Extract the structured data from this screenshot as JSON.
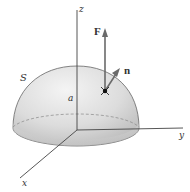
{
  "diagram": {
    "type": "hemisphere-surface-flux",
    "labels": {
      "z_axis": "z",
      "y_axis": "y",
      "x_axis": "x",
      "surface": "S",
      "radius": "a",
      "force": "F",
      "normal": "n"
    },
    "colors": {
      "axis": "#444444",
      "surface_fill_light": "#f0f0f0",
      "surface_fill_dark": "#c8c8c8",
      "surface_edge": "#555555",
      "vector": "#666666",
      "point": "#111111"
    }
  }
}
